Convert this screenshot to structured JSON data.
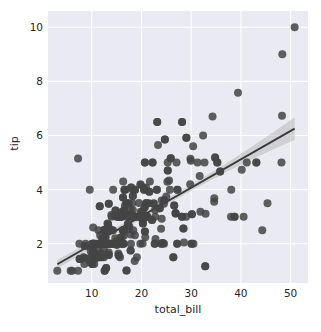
{
  "chart_data": {
    "type": "scatter",
    "title": "",
    "xlabel": "total_bill",
    "ylabel": "tip",
    "xlim": [
      1.2,
      53.5
    ],
    "ylim": [
      0.55,
      10.6
    ],
    "xticks": [
      10,
      20,
      30,
      40,
      50
    ],
    "yticks": [
      2,
      4,
      6,
      8,
      10
    ],
    "grid": true,
    "legend": false,
    "style": {
      "axes_background": "#eaeaf2",
      "grid_color": "#ffffff",
      "point_color": "#444444",
      "line_color": "#3a3a3a",
      "band_color": "#b0b0b0",
      "text_color": "#262626",
      "figure_background": "#ffffff",
      "point_size": 4.0,
      "point_alpha": 0.85
    },
    "regression": {
      "kind": "linear-fit-with-95ci",
      "slope": 0.105,
      "intercept": 0.92,
      "x_start": 3.07,
      "x_end": 50.81,
      "ci_halfwidth_at_start": 0.16,
      "ci_halfwidth_at_mid": 0.11,
      "ci_halfwidth_at_end": 0.42
    },
    "points": [
      [
        16.99,
        1.01
      ],
      [
        10.34,
        1.66
      ],
      [
        21.01,
        3.5
      ],
      [
        23.68,
        3.31
      ],
      [
        24.59,
        3.61
      ],
      [
        25.29,
        4.71
      ],
      [
        8.77,
        2.0
      ],
      [
        26.88,
        3.12
      ],
      [
        15.04,
        1.96
      ],
      [
        14.78,
        3.23
      ],
      [
        10.27,
        1.71
      ],
      [
        35.26,
        5.0
      ],
      [
        15.42,
        1.57
      ],
      [
        18.43,
        3.0
      ],
      [
        14.83,
        3.02
      ],
      [
        21.58,
        3.92
      ],
      [
        10.33,
        1.67
      ],
      [
        16.29,
        3.71
      ],
      [
        16.97,
        3.5
      ],
      [
        20.65,
        3.35
      ],
      [
        17.92,
        4.08
      ],
      [
        20.29,
        2.75
      ],
      [
        15.77,
        2.23
      ],
      [
        39.42,
        7.58
      ],
      [
        19.82,
        3.18
      ],
      [
        17.81,
        2.34
      ],
      [
        13.37,
        2.0
      ],
      [
        12.69,
        2.0
      ],
      [
        21.7,
        4.3
      ],
      [
        19.65,
        3.0
      ],
      [
        9.55,
        1.45
      ],
      [
        18.35,
        2.5
      ],
      [
        15.06,
        3.0
      ],
      [
        20.69,
        2.45
      ],
      [
        17.78,
        3.27
      ],
      [
        24.06,
        3.6
      ],
      [
        16.31,
        2.0
      ],
      [
        16.93,
        3.07
      ],
      [
        18.69,
        2.31
      ],
      [
        31.27,
        5.0
      ],
      [
        16.04,
        2.24
      ],
      [
        17.46,
        2.54
      ],
      [
        13.94,
        3.06
      ],
      [
        9.68,
        1.32
      ],
      [
        30.4,
        5.6
      ],
      [
        18.29,
        3.0
      ],
      [
        22.23,
        5.0
      ],
      [
        32.4,
        6.0
      ],
      [
        28.55,
        2.05
      ],
      [
        18.04,
        3.0
      ],
      [
        12.54,
        2.5
      ],
      [
        10.29,
        2.6
      ],
      [
        34.81,
        5.2
      ],
      [
        9.94,
        1.56
      ],
      [
        25.56,
        4.34
      ],
      [
        19.49,
        3.51
      ],
      [
        38.01,
        3.0
      ],
      [
        26.41,
        1.5
      ],
      [
        11.24,
        1.76
      ],
      [
        48.27,
        6.73
      ],
      [
        20.29,
        3.21
      ],
      [
        13.81,
        2.0
      ],
      [
        11.02,
        1.98
      ],
      [
        18.29,
        3.76
      ],
      [
        17.59,
        2.64
      ],
      [
        20.08,
        3.15
      ],
      [
        16.45,
        2.47
      ],
      [
        3.07,
        1.0
      ],
      [
        20.23,
        2.01
      ],
      [
        15.01,
        2.09
      ],
      [
        12.02,
        1.97
      ],
      [
        17.07,
        3.0
      ],
      [
        26.86,
        3.14
      ],
      [
        25.28,
        5.0
      ],
      [
        14.73,
        2.2
      ],
      [
        10.51,
        1.25
      ],
      [
        17.92,
        3.08
      ],
      [
        27.2,
        4.0
      ],
      [
        22.76,
        3.0
      ],
      [
        17.29,
        2.71
      ],
      [
        19.44,
        3.0
      ],
      [
        16.66,
        3.4
      ],
      [
        10.07,
        1.83
      ],
      [
        32.68,
        5.0
      ],
      [
        15.98,
        2.03
      ],
      [
        34.83,
        5.17
      ],
      [
        13.03,
        2.0
      ],
      [
        18.28,
        4.0
      ],
      [
        24.71,
        5.85
      ],
      [
        21.16,
        3.0
      ],
      [
        28.97,
        3.0
      ],
      [
        22.49,
        3.5
      ],
      [
        5.75,
        1.0
      ],
      [
        16.32,
        4.3
      ],
      [
        22.75,
        3.25
      ],
      [
        40.17,
        4.73
      ],
      [
        27.28,
        4.0
      ],
      [
        12.03,
        1.5
      ],
      [
        21.01,
        3.0
      ],
      [
        12.46,
        1.5
      ],
      [
        11.35,
        2.5
      ],
      [
        15.38,
        3.0
      ],
      [
        44.3,
        2.5
      ],
      [
        22.42,
        3.48
      ],
      [
        20.92,
        4.08
      ],
      [
        15.36,
        1.64
      ],
      [
        20.49,
        4.06
      ],
      [
        25.21,
        4.29
      ],
      [
        18.24,
        3.76
      ],
      [
        14.31,
        4.0
      ],
      [
        14.0,
        3.0
      ],
      [
        7.25,
        1.0
      ],
      [
        38.07,
        4.0
      ],
      [
        23.95,
        2.55
      ],
      [
        25.71,
        4.0
      ],
      [
        17.31,
        3.5
      ],
      [
        29.93,
        5.07
      ],
      [
        10.65,
        1.5
      ],
      [
        12.43,
        1.8
      ],
      [
        24.08,
        2.92
      ],
      [
        11.69,
        2.31
      ],
      [
        13.42,
        1.68
      ],
      [
        14.26,
        2.5
      ],
      [
        15.95,
        2.0
      ],
      [
        12.48,
        2.52
      ],
      [
        29.8,
        4.2
      ],
      [
        8.52,
        1.48
      ],
      [
        14.52,
        2.0
      ],
      [
        11.38,
        2.0
      ],
      [
        22.82,
        2.18
      ],
      [
        19.08,
        1.5
      ],
      [
        20.27,
        2.83
      ],
      [
        11.17,
        1.5
      ],
      [
        12.26,
        2.0
      ],
      [
        18.26,
        3.25
      ],
      [
        8.51,
        1.25
      ],
      [
        10.33,
        2.0
      ],
      [
        14.15,
        2.0
      ],
      [
        16.0,
        2.0
      ],
      [
        13.16,
        2.75
      ],
      [
        17.47,
        3.5
      ],
      [
        34.3,
        6.7
      ],
      [
        41.19,
        5.0
      ],
      [
        27.05,
        5.0
      ],
      [
        16.43,
        2.3
      ],
      [
        8.35,
        1.5
      ],
      [
        18.64,
        1.36
      ],
      [
        11.87,
        1.63
      ],
      [
        19.81,
        4.19
      ],
      [
        28.44,
        2.56
      ],
      [
        15.48,
        2.02
      ],
      [
        16.58,
        4.0
      ],
      [
        7.56,
        1.44
      ],
      [
        10.34,
        2.0
      ],
      [
        43.11,
        5.0
      ],
      [
        13.0,
        2.0
      ],
      [
        13.51,
        2.0
      ],
      [
        18.71,
        4.0
      ],
      [
        12.74,
        2.01
      ],
      [
        13.0,
        2.0
      ],
      [
        16.4,
        2.5
      ],
      [
        20.53,
        4.0
      ],
      [
        16.47,
        3.23
      ],
      [
        26.59,
        3.41
      ],
      [
        38.73,
        3.0
      ],
      [
        24.27,
        2.03
      ],
      [
        12.76,
        2.23
      ],
      [
        30.06,
        2.0
      ],
      [
        25.89,
        5.16
      ],
      [
        48.33,
        9.0
      ],
      [
        13.27,
        2.5
      ],
      [
        28.17,
        6.5
      ],
      [
        12.9,
        1.1
      ],
      [
        28.15,
        3.0
      ],
      [
        11.59,
        1.5
      ],
      [
        7.74,
        1.44
      ],
      [
        30.14,
        3.09
      ],
      [
        12.16,
        2.2
      ],
      [
        13.42,
        3.48
      ],
      [
        8.58,
        1.92
      ],
      [
        15.98,
        3.0
      ],
      [
        13.42,
        1.58
      ],
      [
        16.27,
        2.5
      ],
      [
        10.09,
        2.0
      ],
      [
        20.45,
        3.0
      ],
      [
        13.28,
        2.72
      ],
      [
        22.12,
        2.88
      ],
      [
        24.01,
        2.0
      ],
      [
        15.69,
        3.0
      ],
      [
        11.61,
        3.39
      ],
      [
        10.77,
        1.47
      ],
      [
        15.53,
        3.0
      ],
      [
        10.07,
        1.25
      ],
      [
        12.6,
        1.0
      ],
      [
        32.83,
        1.17
      ],
      [
        35.83,
        4.67
      ],
      [
        29.03,
        5.92
      ],
      [
        27.18,
        2.0
      ],
      [
        22.67,
        2.0
      ],
      [
        17.82,
        1.75
      ],
      [
        18.78,
        3.0
      ],
      [
        20.69,
        5.0
      ],
      [
        16.99,
        1.01
      ],
      [
        24.71,
        5.85
      ],
      [
        21.16,
        3.0
      ],
      [
        23.1,
        4.0
      ],
      [
        6.07,
        1.0
      ],
      [
        20.69,
        2.45
      ],
      [
        23.17,
        6.5
      ],
      [
        9.78,
        1.73
      ],
      [
        7.51,
        2.0
      ],
      [
        14.07,
        2.5
      ],
      [
        13.13,
        2.0
      ],
      [
        17.26,
        2.74
      ],
      [
        24.55,
        2.0
      ],
      [
        19.77,
        2.0
      ],
      [
        29.85,
        5.14
      ],
      [
        48.17,
        5.0
      ],
      [
        25.0,
        3.75
      ],
      [
        13.39,
        2.61
      ],
      [
        16.49,
        2.0
      ],
      [
        21.5,
        3.5
      ],
      [
        12.66,
        2.5
      ],
      [
        16.21,
        2.0
      ],
      [
        13.81,
        2.0
      ],
      [
        17.51,
        3.0
      ],
      [
        24.52,
        3.48
      ],
      [
        20.76,
        2.24
      ],
      [
        31.71,
        4.5
      ],
      [
        10.59,
        1.61
      ],
      [
        10.63,
        2.0
      ],
      [
        50.81,
        10.0
      ],
      [
        15.81,
        3.16
      ],
      [
        7.25,
        5.15
      ],
      [
        31.85,
        3.18
      ],
      [
        16.82,
        4.0
      ],
      [
        32.9,
        3.11
      ],
      [
        17.89,
        2.0
      ],
      [
        14.48,
        2.0
      ],
      [
        9.6,
        4.0
      ],
      [
        34.63,
        3.55
      ],
      [
        34.65,
        3.68
      ],
      [
        23.33,
        5.65
      ],
      [
        45.35,
        3.5
      ],
      [
        23.17,
        6.5
      ],
      [
        40.55,
        3.0
      ],
      [
        20.69,
        5.0
      ],
      [
        20.9,
        3.5
      ],
      [
        30.46,
        2.0
      ],
      [
        18.15,
        3.5
      ],
      [
        23.1,
        4.0
      ],
      [
        15.69,
        1.5
      ],
      [
        19.81,
        4.19
      ],
      [
        28.44,
        2.56
      ],
      [
        15.48,
        2.02
      ],
      [
        16.58,
        4.0
      ],
      [
        7.56,
        1.44
      ],
      [
        10.34,
        2.0
      ],
      [
        43.11,
        5.0
      ],
      [
        13.0,
        2.0
      ],
      [
        13.51,
        2.0
      ],
      [
        18.71,
        4.0
      ],
      [
        12.74,
        2.01
      ],
      [
        13.0,
        2.0
      ],
      [
        16.4,
        2.5
      ],
      [
        20.53,
        4.0
      ],
      [
        16.47,
        3.23
      ],
      [
        26.59,
        3.41
      ],
      [
        38.73,
        3.0
      ],
      [
        24.27,
        2.03
      ],
      [
        12.76,
        2.23
      ],
      [
        30.06,
        2.0
      ],
      [
        25.89,
        5.16
      ],
      [
        13.27,
        2.5
      ],
      [
        28.17,
        6.5
      ],
      [
        12.9,
        1.1
      ],
      [
        28.15,
        3.0
      ],
      [
        11.59,
        1.5
      ],
      [
        7.74,
        1.44
      ],
      [
        30.14,
        3.09
      ],
      [
        12.16,
        2.2
      ],
      [
        13.42,
        3.48
      ],
      [
        8.58,
        1.92
      ],
      [
        15.98,
        3.0
      ],
      [
        13.42,
        1.58
      ],
      [
        16.27,
        2.5
      ],
      [
        10.09,
        2.0
      ],
      [
        20.45,
        3.0
      ],
      [
        13.28,
        2.72
      ],
      [
        22.12,
        2.88
      ],
      [
        24.01,
        2.0
      ],
      [
        15.69,
        3.0
      ],
      [
        11.61,
        3.39
      ],
      [
        10.77,
        1.47
      ],
      [
        15.53,
        3.0
      ],
      [
        10.07,
        1.25
      ],
      [
        12.6,
        1.0
      ],
      [
        32.83,
        1.17
      ],
      [
        35.83,
        4.67
      ],
      [
        29.03,
        5.92
      ],
      [
        27.18,
        2.0
      ],
      [
        22.67,
        2.0
      ],
      [
        17.82,
        1.75
      ],
      [
        18.78,
        3.0
      ],
      [
        22.23,
        5.0
      ],
      [
        26.41,
        1.5
      ],
      [
        23.68,
        3.31
      ],
      [
        25.29,
        4.71
      ],
      [
        26.88,
        3.12
      ],
      [
        24.59,
        3.61
      ],
      [
        21.01,
        3.5
      ],
      [
        19.65,
        3.0
      ],
      [
        20.29,
        2.75
      ],
      [
        17.92,
        4.08
      ],
      [
        20.65,
        3.35
      ],
      [
        16.97,
        3.5
      ],
      [
        16.29,
        3.71
      ],
      [
        21.58,
        3.92
      ],
      [
        14.83,
        3.02
      ],
      [
        18.43,
        3.0
      ],
      [
        15.42,
        1.57
      ],
      [
        35.26,
        5.0
      ],
      [
        10.27,
        1.71
      ],
      [
        14.78,
        3.23
      ],
      [
        15.04,
        1.96
      ]
    ]
  },
  "axes": {
    "x_tick_labels": [
      "10",
      "20",
      "30",
      "40",
      "50"
    ],
    "y_tick_labels": [
      "2",
      "4",
      "6",
      "8",
      "10"
    ],
    "x_axis_title": "total_bill",
    "y_axis_title": "tip"
  }
}
